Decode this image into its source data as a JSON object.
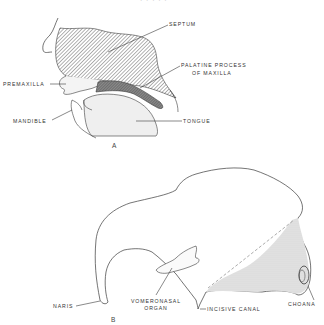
{
  "figure": {
    "top_caption_fragment": "· · · · ·",
    "panel_a": {
      "label": "A",
      "structures": {
        "septum": "SEPTUM",
        "palatine_process_line1": "PALATINE PROCESS",
        "palatine_process_line2": "OF MAXILLA",
        "premaxilla": "PREMAXILLA",
        "mandible": "MANDIBLE",
        "tongue": "TONGUE"
      }
    },
    "panel_b": {
      "label": "B",
      "structures": {
        "naris": "NARIS",
        "vomeronasal_line1": "VOMERONASAL",
        "vomeronasal_line2": "ORGAN",
        "incisive_canal": "INCISIVE CANAL",
        "choana": "CHOANA"
      }
    },
    "colors": {
      "line": "#3a3a3a",
      "hatch": "#555555",
      "stipple": "#bdbdbd",
      "background": "#ffffff"
    }
  }
}
